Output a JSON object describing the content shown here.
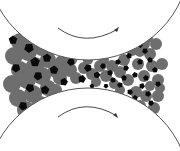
{
  "diagram": {
    "type": "roll-compaction",
    "colors": {
      "background": "#ffffff",
      "roller_outline": "#555555",
      "arrow": "#333333",
      "granule": "#6e6e6e",
      "fine_particle": "#0a0a0a"
    },
    "rollers": [
      {
        "name": "top-roller",
        "cx": 88,
        "cy": -42,
        "r": 102,
        "rotation": "clockwise"
      },
      {
        "name": "bottom-roller",
        "cx": 88,
        "cy": 190,
        "r": 102,
        "rotation": "clockwise"
      }
    ],
    "arrows": [
      {
        "name": "top-rotation-arrow",
        "path": "M58,28 Q85,48 118,29",
        "head": [
          118,
          29
        ]
      },
      {
        "name": "bottom-rotation-arrow",
        "path": "M58,117 Q85,97 117,116",
        "head": [
          117,
          116
        ]
      }
    ],
    "granules": [
      [
        20,
        42,
        9
      ],
      [
        34,
        38,
        9
      ],
      [
        14,
        56,
        9
      ],
      [
        28,
        52,
        9
      ],
      [
        42,
        48,
        8
      ],
      [
        20,
        70,
        9
      ],
      [
        35,
        66,
        9
      ],
      [
        48,
        60,
        8
      ],
      [
        12,
        84,
        9
      ],
      [
        27,
        80,
        9
      ],
      [
        42,
        76,
        9
      ],
      [
        56,
        70,
        8
      ],
      [
        18,
        98,
        9
      ],
      [
        33,
        94,
        9
      ],
      [
        48,
        88,
        8
      ],
      [
        26,
        110,
        9
      ],
      [
        40,
        104,
        8
      ],
      [
        62,
        62,
        7
      ],
      [
        70,
        70,
        7
      ],
      [
        60,
        78,
        7
      ],
      [
        76,
        78,
        6
      ],
      [
        84,
        68,
        6
      ],
      [
        92,
        74,
        6
      ],
      [
        100,
        66,
        6
      ],
      [
        96,
        82,
        5
      ],
      [
        106,
        76,
        6
      ],
      [
        112,
        66,
        6
      ],
      [
        114,
        84,
        5
      ],
      [
        120,
        72,
        6
      ],
      [
        124,
        60,
        6
      ],
      [
        128,
        80,
        6
      ],
      [
        132,
        50,
        6
      ],
      [
        138,
        64,
        6
      ],
      [
        144,
        44,
        6
      ],
      [
        150,
        54,
        6
      ],
      [
        136,
        92,
        6
      ],
      [
        144,
        76,
        6
      ],
      [
        152,
        66,
        6
      ],
      [
        158,
        80,
        6
      ],
      [
        146,
        96,
        6
      ],
      [
        158,
        96,
        6
      ],
      [
        140,
        106,
        6
      ],
      [
        154,
        108,
        6
      ],
      [
        162,
        64,
        6
      ],
      [
        130,
        104,
        5
      ],
      [
        156,
        44,
        6
      ],
      [
        148,
        38,
        5
      ],
      [
        120,
        90,
        5
      ],
      [
        104,
        60,
        5
      ],
      [
        88,
        60,
        5
      ],
      [
        72,
        60,
        5
      ],
      [
        56,
        90,
        6
      ],
      [
        160,
        88,
        5
      ],
      [
        150,
        86,
        5
      ],
      [
        134,
        40,
        5
      ],
      [
        140,
        52,
        5
      ]
    ],
    "fine_particles": [
      [
        13,
        40,
        4.5
      ],
      [
        29,
        48,
        5
      ],
      [
        35,
        62,
        5
      ],
      [
        16,
        68,
        4.5
      ],
      [
        47,
        58,
        4.5
      ],
      [
        38,
        76,
        4.5
      ],
      [
        54,
        70,
        4.5
      ],
      [
        30,
        88,
        4.5
      ],
      [
        45,
        90,
        4.5
      ],
      [
        23,
        106,
        4.5
      ],
      [
        64,
        82,
        4
      ],
      [
        71,
        62,
        4
      ],
      [
        82,
        79,
        4
      ],
      [
        88,
        68,
        4
      ],
      [
        97,
        75,
        3.5
      ],
      [
        103,
        66,
        3
      ],
      [
        110,
        73,
        3
      ],
      [
        113,
        80,
        3
      ],
      [
        118,
        62,
        3
      ],
      [
        120,
        85,
        3
      ],
      [
        126,
        68,
        3
      ],
      [
        129,
        56,
        3
      ],
      [
        130,
        92,
        3
      ],
      [
        135,
        75,
        3
      ],
      [
        140,
        45,
        3
      ],
      [
        140,
        62,
        3
      ],
      [
        142,
        86,
        3
      ],
      [
        146,
        78,
        3
      ],
      [
        148,
        94,
        3
      ],
      [
        150,
        60,
        3
      ],
      [
        151,
        103,
        3
      ],
      [
        155,
        70,
        3
      ],
      [
        158,
        84,
        3
      ],
      [
        135,
        98,
        3
      ],
      [
        145,
        51,
        3
      ],
      [
        124,
        78,
        3
      ],
      [
        106,
        86,
        2.5
      ],
      [
        92,
        86,
        2.5
      ]
    ]
  }
}
